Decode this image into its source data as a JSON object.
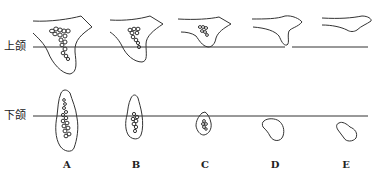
{
  "rows": {
    "upper": {
      "label": "上颌"
    },
    "lower": {
      "label": "下颌"
    }
  },
  "columns": [
    {
      "label": "A"
    },
    {
      "label": "B"
    },
    {
      "label": "C"
    },
    {
      "label": "D"
    },
    {
      "label": "E"
    }
  ]
}
